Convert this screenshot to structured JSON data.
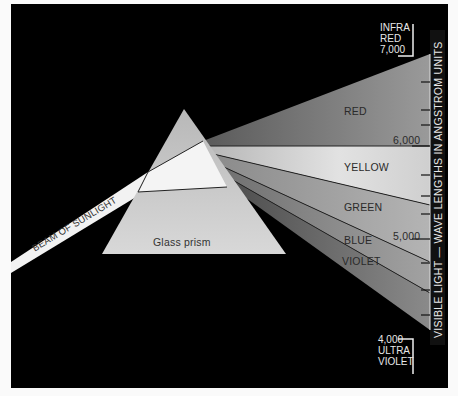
{
  "diagram": {
    "beam_label": "BEAM OF SUNLIGHT",
    "prism_label": "Glass prism",
    "bands": [
      {
        "name": "RED",
        "color": "#8a8a8a"
      },
      {
        "name": "YELLOW",
        "color": "#d6d6d6"
      },
      {
        "name": "GREEN",
        "color": "#a6a6a6"
      },
      {
        "name": "BLUE",
        "color": "#939393"
      },
      {
        "name": "VIOLET",
        "color": "#7a7a7a"
      }
    ],
    "scale": {
      "top_label": "INFRA\nRED\n7,000",
      "bottom_label": "4,000\nULTRA\nVIOLET",
      "tick_6000": "6,000",
      "tick_5000": "5,000",
      "axis_title": "VISIBLE LIGHT — WAVE LENGTHS IN ANGSTROM UNITS"
    },
    "colors": {
      "background": "#000000",
      "frame": "#fafafa",
      "beam": "#f2f2f2",
      "prism": "#cfcfcf"
    }
  }
}
